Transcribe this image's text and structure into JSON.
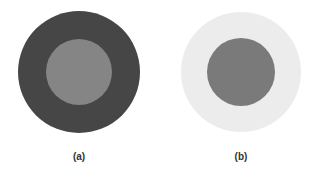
{
  "figure": {
    "panels": [
      {
        "label": "(a)",
        "outer_circle": {
          "cx": 79,
          "cy": 72,
          "r": 61,
          "color": "#464646"
        },
        "inner_circle": {
          "cx": 79,
          "cy": 72,
          "r": 33,
          "color": "#858585"
        }
      },
      {
        "label": "(b)",
        "outer_circle": {
          "cx": 241,
          "cy": 72,
          "r": 60,
          "color": "#ECECEC"
        },
        "inner_circle": {
          "cx": 241,
          "cy": 72,
          "r": 34,
          "color": "#7A7A7A"
        }
      }
    ],
    "background": "#FFFFFF"
  }
}
